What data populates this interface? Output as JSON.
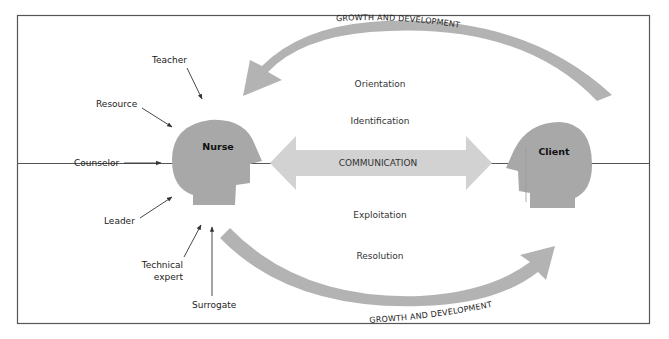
{
  "diagram": {
    "type": "Nurse-client relationship (Peplau's model)",
    "frame_color": "#555555",
    "heads": {
      "nurse": {
        "label": "Nurse",
        "color": "#a8a8a8"
      },
      "client": {
        "label": "Client",
        "color": "#a8a8a8"
      }
    },
    "communication": {
      "label": "COMMUNICATION",
      "color": "#d2d2d2"
    },
    "arcs": {
      "top_label": "GROWTH AND DEVELOPMENT",
      "bottom_label": "GROWTH AND DEVELOPMENT",
      "color": "#b3b3b3"
    },
    "phases": [
      {
        "label": "Orientation"
      },
      {
        "label": "Identification"
      },
      {
        "label": "Exploitation"
      },
      {
        "label": "Resolution"
      }
    ],
    "nurse_roles": [
      {
        "label": "Teacher"
      },
      {
        "label": "Resource"
      },
      {
        "label": "Counselor"
      },
      {
        "label": "Leader"
      },
      {
        "label": "Technical"
      },
      {
        "label": "expert"
      },
      {
        "label": "Surrogate"
      }
    ]
  }
}
